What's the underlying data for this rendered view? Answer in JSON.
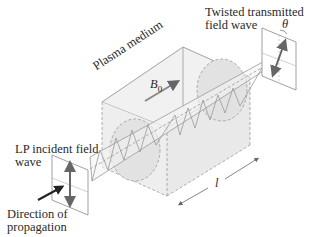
{
  "labels": {
    "twisted_line1": "Twisted transmitted",
    "twisted_line2": "field wave",
    "theta": "θ",
    "plasma": "Plasma medium",
    "b_field": "B",
    "b_sub": "0",
    "lp_line1": "LP incident field",
    "lp_line2": "wave",
    "direction_line1": "Direction of",
    "direction_line2": "propagation",
    "length": "l"
  },
  "colors": {
    "line": "#8a8a8a",
    "dashed": "#9a9a9a",
    "arrow_dark": "#555555",
    "arrow_black": "#1a1a1a",
    "shade": "#e6e6e6"
  }
}
